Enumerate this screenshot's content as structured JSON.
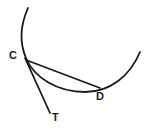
{
  "figure": {
    "background_color": "#ffffff",
    "stroke_color": "#1a1a1a",
    "width": 147,
    "height": 130,
    "labels": [
      {
        "id": "C",
        "text": "C",
        "x": 14,
        "y": 56,
        "description": "point of tangency on circle"
      },
      {
        "id": "D",
        "text": "D",
        "x": 101,
        "y": 97,
        "description": "second point on circle"
      },
      {
        "id": "T",
        "text": "T",
        "x": 56,
        "y": 118,
        "description": "endpoint of tangent ray"
      }
    ],
    "elements": [
      {
        "id": "circle-arc",
        "name": "circle-arc",
        "kind": "arc",
        "stroke_width": 1.8,
        "path": "M 28 8 C 20 26 20 44 26 58 C 34 78 58 92 85 92 C 110 92 130 76 140 52"
      },
      {
        "id": "chord-cd",
        "name": "chord-c-to-d",
        "kind": "line",
        "stroke_width": 1.8,
        "path": "M 26 60 L 100 88"
      },
      {
        "id": "tangent-ct",
        "name": "tangent-c-to-t",
        "kind": "line",
        "stroke_width": 1.8,
        "path": "M 25 58 L 50 113"
      }
    ]
  }
}
